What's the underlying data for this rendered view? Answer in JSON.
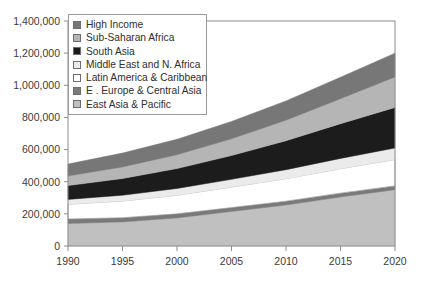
{
  "chart_data": {
    "type": "area",
    "stacked": true,
    "title": "",
    "xlabel": "",
    "ylabel": "",
    "x": [
      1990,
      1995,
      2000,
      2005,
      2010,
      2015,
      2020
    ],
    "xlim": [
      1990,
      2020
    ],
    "ylim": [
      0,
      1400000
    ],
    "xticks": [
      "1990",
      "1995",
      "2000",
      "2005",
      "2010",
      "2015",
      "2020"
    ],
    "yticks": [
      "0",
      "200,000",
      "400,000",
      "600,000",
      "800,000",
      "1,000,000",
      "1,200,000",
      "1,400,000"
    ],
    "ytick_values": [
      0,
      200000,
      400000,
      600000,
      800000,
      1000000,
      1200000,
      1400000
    ],
    "grid": false,
    "legend_position": "top-left",
    "stack_order_bottom_to_top": [
      "East Asia & Pacific",
      "E . Europe & Central Asia",
      "Latin America & Caribbean",
      "Middle East and N. Africa",
      "South Asia",
      "Sub-Saharan Africa",
      "High Income"
    ],
    "series": [
      {
        "name": "East Asia & Pacific",
        "color": "#c0c0c0",
        "values": [
          140000,
          150000,
          175000,
          215000,
          255000,
          305000,
          350000
        ]
      },
      {
        "name": "E . Europe & Central Asia",
        "color": "#7a7a7a",
        "values": [
          28000,
          26000,
          25000,
          24000,
          24000,
          24000,
          24000
        ]
      },
      {
        "name": "Latin America & Caribbean",
        "color": "#ffffff",
        "values": [
          92000,
          104000,
          116000,
          128000,
          140000,
          152000,
          164000
        ]
      },
      {
        "name": "Middle East and N. Africa",
        "color": "#ebebeb",
        "values": [
          30000,
          36000,
          42000,
          48000,
          56000,
          64000,
          72000
        ]
      },
      {
        "name": "South Asia",
        "color": "#1c1c1c",
        "values": [
          86000,
          104000,
          124000,
          148000,
          180000,
          216000,
          252000
        ]
      },
      {
        "name": "Sub-Saharan Africa",
        "color": "#b5b5b5",
        "values": [
          60000,
          72000,
          86000,
          104000,
          128000,
          156000,
          190000
        ]
      },
      {
        "name": "High Income",
        "color": "#777777",
        "values": [
          74000,
          86000,
          96000,
          108000,
          120000,
          133000,
          148000
        ]
      }
    ]
  },
  "legend": {
    "items": [
      {
        "label": "High Income",
        "color": "#777777"
      },
      {
        "label": "Sub-Saharan Africa",
        "color": "#b5b5b5"
      },
      {
        "label": "South Asia",
        "color": "#1c1c1c"
      },
      {
        "label": "Middle East and N. Africa",
        "color": "#ebebeb"
      },
      {
        "label": "Latin America & Caribbean",
        "color": "#ffffff"
      },
      {
        "label": "E . Europe & Central Asia",
        "color": "#7a7a7a"
      },
      {
        "label": "East Asia & Pacific",
        "color": "#c0c0c0"
      }
    ]
  },
  "axes": {
    "frame_color": "#8c8c8c",
    "tick_color": "#8c8c8c"
  }
}
